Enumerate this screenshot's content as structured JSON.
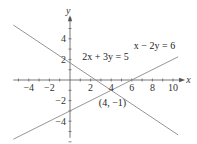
{
  "chart_data": {
    "type": "line",
    "title": "",
    "xlabel": "x",
    "ylabel": "y",
    "xlim": [
      -5.5,
      10.5
    ],
    "ylim": [
      -6,
      6
    ],
    "grid": false,
    "x_tick_labels": [
      {
        "value": -4,
        "label": "−4"
      },
      {
        "value": -2,
        "label": "−2"
      },
      {
        "value": 2,
        "label": "2"
      },
      {
        "value": 4,
        "label": "4"
      },
      {
        "value": 6,
        "label": "6"
      },
      {
        "value": 8,
        "label": "8"
      },
      {
        "value": 10,
        "label": "10"
      }
    ],
    "y_tick_labels": [
      {
        "value": 4,
        "label": "4"
      },
      {
        "value": 2,
        "label": "2"
      },
      {
        "value": -2,
        "label": "−2"
      },
      {
        "value": -4,
        "label": "−4"
      }
    ],
    "series": [
      {
        "name": "2x + 3y = 5",
        "a": 2,
        "b": 3,
        "c": 5,
        "x_range": [
          -5.5,
          10.5
        ],
        "label_at": [
          1.2,
          1.9
        ]
      },
      {
        "name": "x − 2y = 6",
        "a": 1,
        "b": -2,
        "c": 6,
        "x_range": [
          -5.5,
          10.5
        ],
        "label_at": [
          6.2,
          3.0
        ]
      }
    ],
    "annotations": [
      {
        "text": "(4, −1)",
        "x": 4,
        "y": -1,
        "label_at": [
          2.8,
          -2.5
        ]
      }
    ]
  }
}
